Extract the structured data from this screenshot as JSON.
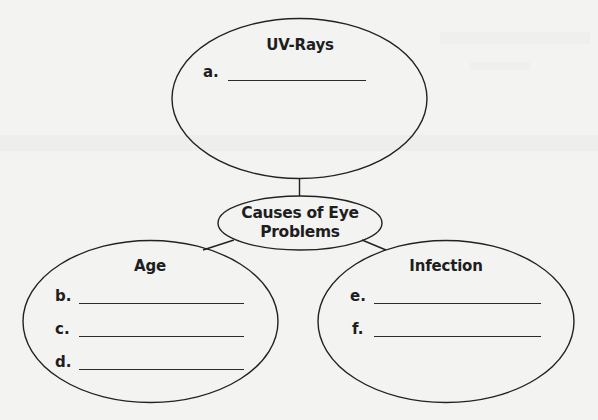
{
  "diagram": {
    "type": "concept-map",
    "colors": {
      "background": "#f3f3f2",
      "stroke": "#222222",
      "text": "#1e1e1e"
    },
    "center": {
      "title_line1": "Causes of Eye",
      "title_line2": "Problems"
    },
    "nodes": [
      {
        "id": "uv-rays",
        "title": "UV-Rays",
        "items": [
          {
            "label": "a.",
            "value": ""
          }
        ]
      },
      {
        "id": "age",
        "title": "Age",
        "items": [
          {
            "label": "b.",
            "value": ""
          },
          {
            "label": "c.",
            "value": ""
          },
          {
            "label": "d.",
            "value": ""
          }
        ]
      },
      {
        "id": "infection",
        "title": "Infection",
        "items": [
          {
            "label": "e.",
            "value": ""
          },
          {
            "label": "f.",
            "value": ""
          }
        ]
      }
    ]
  }
}
